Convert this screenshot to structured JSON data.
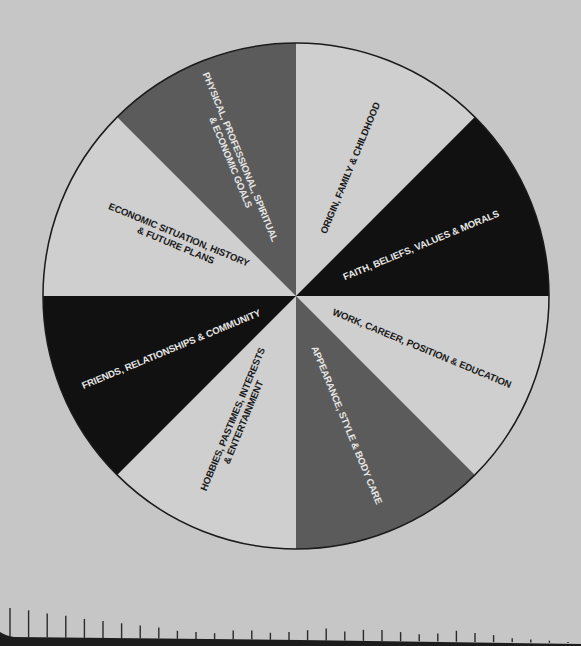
{
  "diagram": {
    "type": "segmented-wheel",
    "center": [
      296,
      296
    ],
    "radius": 253,
    "colors": {
      "background": "#c6c6c6",
      "light": "#cfcfcf",
      "black": "#111111",
      "gray": "#5b5b5b",
      "outline": "#1a1a1a",
      "text_dark": "#1a1a1a",
      "text_light": "#e6e6e6"
    },
    "segments": [
      {
        "id": "origin",
        "line1": "ORIGIN, FAMILY & CHILDHOOD",
        "line2": "",
        "fill": "light"
      },
      {
        "id": "faith",
        "line1": "FAITH, BELIEFS, VALUES & MORALS",
        "line2": "",
        "fill": "black"
      },
      {
        "id": "work",
        "line1": "WORK, CAREER, POSITION & EDUCATION",
        "line2": "",
        "fill": "light"
      },
      {
        "id": "appearance",
        "line1": "APPEARANCE, STYLE & BODY CARE",
        "line2": "",
        "fill": "gray"
      },
      {
        "id": "hobbies",
        "line1": "HOBBIES, PASTIMES, INTERESTS",
        "line2": "& ENTERTAINMENT",
        "fill": "light"
      },
      {
        "id": "friends",
        "line1": "FRIENDS, RELATIONSHIPS & COMMUNITY",
        "line2": "",
        "fill": "black"
      },
      {
        "id": "economic",
        "line1": "ECONOMIC SITUATION, HISTORY",
        "line2": "& FUTURE PLANS",
        "fill": "light"
      },
      {
        "id": "goals",
        "line1": "PHYSICAL, PROFESSIONAL, SPIRITUAL",
        "line2": "& ECONOMIC GOALS",
        "fill": "gray"
      }
    ]
  },
  "ruler": {
    "tick_count": 31,
    "start_x": 10,
    "spacing": 18.6
  }
}
